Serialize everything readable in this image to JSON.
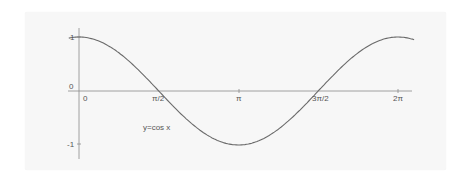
{
  "chart_data": {
    "type": "line",
    "title": "",
    "series": [
      {
        "name": "y=cos x",
        "function": "cos(x)",
        "x_range": [
          -0.2,
          6.6
        ]
      }
    ],
    "annotations": [
      "y=cos x"
    ],
    "xlabel": "",
    "ylabel": "",
    "x_ticks": [
      {
        "value": 0,
        "label": "0"
      },
      {
        "value": 1.5708,
        "label": "π/2"
      },
      {
        "value": 3.1416,
        "label": "π"
      },
      {
        "value": 4.7124,
        "label": "3π/2"
      },
      {
        "value": 6.2832,
        "label": "2π"
      }
    ],
    "y_ticks": [
      {
        "value": 1,
        "label": "1"
      },
      {
        "value": 0,
        "label": "0"
      },
      {
        "value": -1,
        "label": "-1"
      }
    ],
    "xlim": [
      -0.4,
      6.9
    ],
    "ylim": [
      -1.3,
      1.1
    ],
    "grid": false,
    "legend": "none",
    "colors": {
      "curve": "#6a6a6a",
      "axis": "#8a8a8a",
      "background": "#f7f7f7"
    }
  },
  "labels": {
    "origin_y": "0",
    "y_one": "1",
    "y_neg_one": "-1",
    "x_zero": "0",
    "x_pi_2": "π/2",
    "x_pi": "π",
    "x_3pi_2": "3π/2",
    "x_2pi": "2π",
    "curve_label": "y=cos x"
  }
}
